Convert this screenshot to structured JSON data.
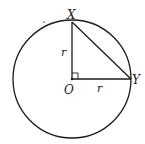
{
  "diagram": {
    "circle": {
      "cx": 72,
      "cy": 79,
      "r": 59
    },
    "points": {
      "X": {
        "label": "X",
        "x": 72,
        "y": 22
      },
      "Y": {
        "label": "Y",
        "x": 131,
        "y": 79
      },
      "O": {
        "label": "O",
        "x": 72,
        "y": 79
      }
    },
    "segment_labels": {
      "OX": "r",
      "OY": "r"
    },
    "right_angle_at": "O",
    "stroke_color": "#1a1a1a"
  }
}
